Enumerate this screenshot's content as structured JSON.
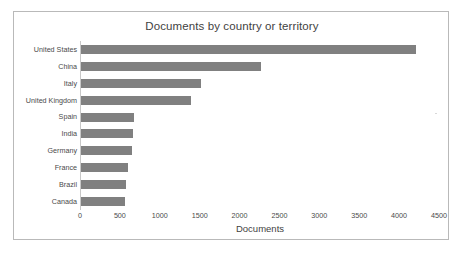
{
  "chart_data": {
    "type": "bar",
    "orientation": "horizontal",
    "title": "Documents by country or territory",
    "xlabel": "Documents",
    "ylabel": "",
    "categories": [
      "United States",
      "China",
      "Italy",
      "United Kingdom",
      "Spain",
      "India",
      "Germany",
      "France",
      "Brazil",
      "Canada"
    ],
    "values": [
      4200,
      2250,
      1500,
      1380,
      660,
      650,
      640,
      590,
      565,
      550
    ],
    "xlim": [
      0,
      4500
    ],
    "xticks": [
      0,
      500,
      1000,
      1500,
      2000,
      2500,
      3000,
      3500,
      4000,
      4500
    ],
    "xtick_labels": [
      "0",
      "500",
      "1000",
      "1500",
      "2000",
      "2500",
      "3000",
      "3500",
      "4000",
      "4500"
    ],
    "grid": false,
    "legend": false,
    "bar_color": "#808080",
    "border_color": "#b9b9b9",
    "text_color": "#4a4a4a",
    "background": "#ffffff"
  }
}
